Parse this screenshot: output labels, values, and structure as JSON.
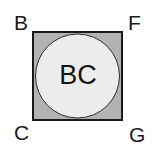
{
  "figure": {
    "type": "geometric-diagram",
    "canvas": {
      "width": 156,
      "height": 151,
      "background_color": "#ffffff"
    },
    "square": {
      "name": "outer-square",
      "x": 32,
      "y": 31,
      "width": 91,
      "height": 90,
      "fill_color": "#b3b3b3",
      "stroke_color": "#1a1a1a",
      "stroke_width": 2
    },
    "circle": {
      "name": "inscribed-circle",
      "cx": 77.5,
      "cy": 76,
      "r": 42,
      "fill_color": "#ececec",
      "stroke_color": "#2b2b2b",
      "stroke_width": 1
    },
    "center_label": "BC",
    "corner_labels": {
      "top_left": "B",
      "top_right": "F",
      "bottom_left": "C",
      "bottom_right": "G"
    }
  }
}
